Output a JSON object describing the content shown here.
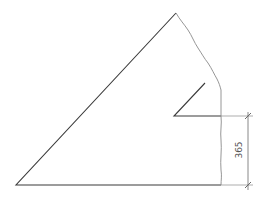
{
  "diagram": {
    "type": "technical-drawing",
    "colors": {
      "outline": "#3a3a3a",
      "break_line": "#8a8a8a",
      "dimension": "#6a6a6a",
      "background": "#ffffff"
    },
    "dimension": {
      "label": "365",
      "orientation": "vertical"
    }
  }
}
